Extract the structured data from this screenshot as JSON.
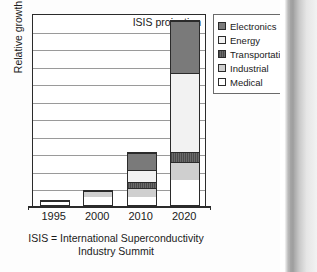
{
  "figure": {
    "annotation": "ISIS projection",
    "caption_line1": "ISIS = International Superconductivity",
    "caption_line2": "Industry Summit"
  },
  "legend": {
    "items": [
      {
        "label": "Electronics",
        "swatch": "electronics-swatch",
        "color": "#7a7a7a"
      },
      {
        "label": "Energy",
        "swatch": "energy-swatch",
        "color": "#f2f2f2"
      },
      {
        "label": "Transportation",
        "swatch": "transportation-swatch",
        "color": "#595959"
      },
      {
        "label": "Industrial",
        "swatch": "industrial-swatch",
        "color": "#cfcfcf"
      },
      {
        "label": "Medical",
        "swatch": "medical-swatch",
        "color": "#ffffff"
      }
    ]
  },
  "chart_data": {
    "type": "bar",
    "subtype": "stacked-bar",
    "title": "",
    "annotation": "ISIS projection",
    "xlabel": "",
    "ylabel": "Relative growth",
    "categories": [
      "1995",
      "2000",
      "2010",
      "2020"
    ],
    "ylim": [
      0,
      11
    ],
    "y_tick_labels": [],
    "gridlines": 11,
    "grid": true,
    "legend_position": "right",
    "stack_order_bottom_to_top": [
      "Medical",
      "Industrial",
      "Transportation",
      "Energy",
      "Electronics"
    ],
    "series": [
      {
        "name": "Medical",
        "color": "#ffffff",
        "values": [
          0.3,
          0.55,
          0.45,
          1.45
        ]
      },
      {
        "name": "Industrial",
        "color": "#cfcfcf",
        "values": [
          0.05,
          0.35,
          0.55,
          1.05
        ]
      },
      {
        "name": "Transportation",
        "color": "#595959",
        "values": [
          0.0,
          0.0,
          0.35,
          0.55
        ]
      },
      {
        "name": "Energy",
        "color": "#f2f2f2",
        "values": [
          0.0,
          0.0,
          0.75,
          4.55
        ]
      },
      {
        "name": "Electronics",
        "color": "#7a7a7a",
        "values": [
          0.0,
          0.0,
          1.0,
          3.0
        ]
      }
    ],
    "totals": [
      0.35,
      0.9,
      3.1,
      10.6
    ],
    "units": "relative growth (arbitrary units, 1 unit = 1 gridline)"
  },
  "axis": {
    "x_tick_labels": [
      "1995",
      "2000",
      "2010",
      "2020"
    ]
  }
}
